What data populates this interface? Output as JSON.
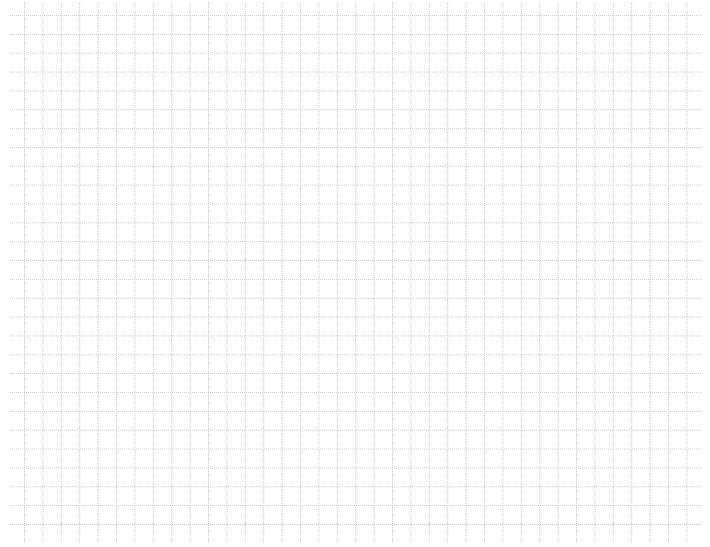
{
  "grid": {
    "background": "#ffffff",
    "line_color": "#cfcfcf",
    "line_style": "dotted",
    "x_start": 24.5,
    "x_step": 18.4,
    "x_count": 37,
    "y_start": 15.5,
    "y_step": 18.85,
    "y_count": 28,
    "left_bound": 10,
    "right_bound": 702,
    "top_bound": 3,
    "bottom_bound": 542
  }
}
